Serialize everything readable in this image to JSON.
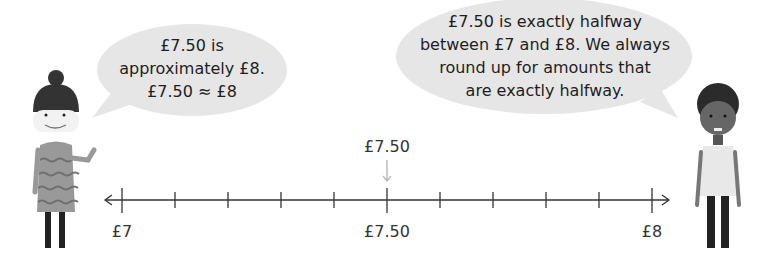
{
  "left_speech": {
    "lines": [
      "£7.50 is",
      "approximately £8.",
      "£7.50 ≈ £8"
    ]
  },
  "right_speech": {
    "lines": [
      "£7.50 is exactly halfway",
      "between £7 and £8. We always",
      "round up for amounts that",
      "are exactly halfway."
    ]
  },
  "number_line": {
    "start_label": "£7",
    "mid_label": "£7.50",
    "end_label": "£8",
    "marker_label": "£7.50",
    "tick_count": 11,
    "colors": {
      "line": "#333333",
      "arrow_marker": "#bbbbbb"
    }
  },
  "characters": {
    "left": "girl-with-bun",
    "right": "boy-with-curly-hair"
  }
}
